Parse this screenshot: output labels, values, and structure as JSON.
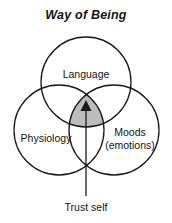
{
  "figure": {
    "title": "Way of Being",
    "background_color": "#ffffff",
    "stroke_color": "#1a1a1a",
    "intersection_fill": "#bcbcbc"
  },
  "diagram": {
    "type": "venn-3-circle",
    "circles": [
      {
        "id": "language",
        "label": "Language",
        "position": "top",
        "cx": 86,
        "cy": 82,
        "r": 45
      },
      {
        "id": "physiology",
        "label": "Physiology",
        "position": "bottom-left",
        "cx": 59,
        "cy": 130,
        "r": 45
      },
      {
        "id": "moods",
        "label": "Moods\n(emotions)",
        "label_line1": "Moods",
        "label_line2": "(emotions)",
        "position": "bottom-right",
        "cx": 114,
        "cy": 130,
        "r": 45
      }
    ],
    "center_region": {
      "name": "triple-intersection",
      "shaded": true,
      "fill": "#bcbcbc"
    },
    "arrow": {
      "name": "trust-self-arrow",
      "direction": "up",
      "caption": "Trust self",
      "from_y": 196,
      "to_y": 104,
      "x": 86
    }
  },
  "caption": {
    "text": "Trust self"
  }
}
